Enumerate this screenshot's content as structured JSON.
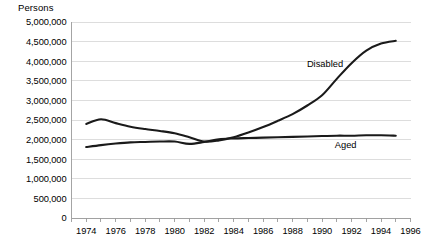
{
  "chart_data": {
    "type": "line",
    "title": "Persons",
    "xlabel": "",
    "ylabel": "Persons",
    "xlim": [
      1973,
      1996
    ],
    "ylim": [
      0,
      5000000
    ],
    "grid": true,
    "legend_position": "inline-annotations",
    "y_ticks": [
      0,
      500000,
      1000000,
      1500000,
      2000000,
      2500000,
      3000000,
      3500000,
      4000000,
      4500000,
      5000000
    ],
    "y_tick_labels": [
      "0",
      "500,000",
      "1,000,000",
      "1,500,000",
      "2,000,000",
      "2,500,000",
      "3,000,000",
      "3,500,000",
      "4,000,000",
      "4,500,000",
      "5,000,000"
    ],
    "x_ticks": [
      1973,
      1974,
      1975,
      1976,
      1977,
      1978,
      1979,
      1980,
      1981,
      1982,
      1983,
      1984,
      1985,
      1986,
      1987,
      1988,
      1989,
      1990,
      1991,
      1992,
      1993,
      1994,
      1995,
      1996
    ],
    "x_tick_labels": [
      "1974",
      "1976",
      "1978",
      "1980",
      "1982",
      "1984",
      "1986",
      "1988",
      "1990",
      "1992",
      "1994",
      "1996"
    ],
    "x_tick_label_years": [
      1974,
      1976,
      1978,
      1980,
      1982,
      1984,
      1986,
      1988,
      1990,
      1992,
      1994,
      1996
    ],
    "x": [
      1974,
      1975,
      1976,
      1977,
      1978,
      1979,
      1980,
      1981,
      1982,
      1983,
      1984,
      1985,
      1986,
      1987,
      1988,
      1989,
      1990,
      1991,
      1992,
      1993,
      1994,
      1995
    ],
    "series": [
      {
        "name": "Disabled",
        "color": "#1a1a1a",
        "label_x": 1990.2,
        "label_y": 3850000,
        "values": [
          2400000,
          2520000,
          2420000,
          2330000,
          2270000,
          2220000,
          2160000,
          2060000,
          1950000,
          1980000,
          2060000,
          2180000,
          2320000,
          2480000,
          2650000,
          2870000,
          3130000,
          3550000,
          3950000,
          4270000,
          4450000,
          4520000
        ]
      },
      {
        "name": "Aged",
        "color": "#1a1a1a",
        "label_x": 1991.6,
        "label_y": 1780000,
        "values": [
          1810000,
          1860000,
          1900000,
          1930000,
          1940000,
          1950000,
          1950000,
          1890000,
          1940000,
          2010000,
          2030000,
          2040000,
          2050000,
          2060000,
          2070000,
          2080000,
          2090000,
          2100000,
          2100000,
          2110000,
          2110000,
          2100000
        ]
      }
    ]
  }
}
